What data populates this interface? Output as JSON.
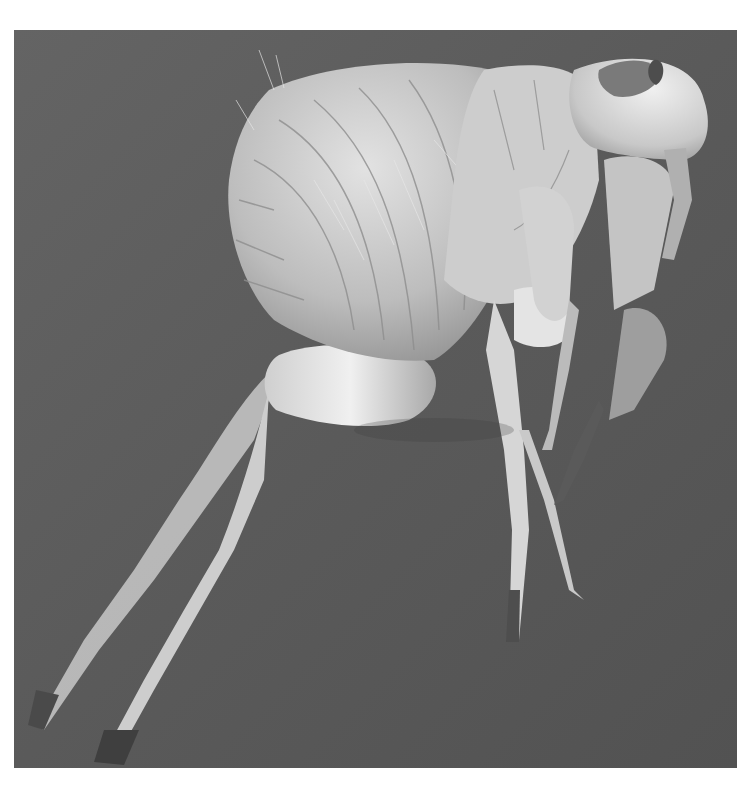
{
  "image": {
    "subject": "Scanning electron micrograph of a flea (side view)",
    "style": "grayscale",
    "colors": {
      "page_background": "#ffffff",
      "photo_background": "#5f5f5f",
      "photo_background_dark": "#4a4a4a",
      "body_light": "#d6d6d6",
      "body_mid": "#b4b4b4",
      "body_shadow": "#8a8a8a",
      "highlight": "#f2f2f2"
    },
    "frame": {
      "left": 14,
      "top": 30,
      "width": 723,
      "height": 738
    },
    "visible_parts": [
      "head",
      "abdomen-segments",
      "thorax",
      "hind-leg",
      "middle-leg",
      "fore-leg",
      "bristles"
    ]
  }
}
